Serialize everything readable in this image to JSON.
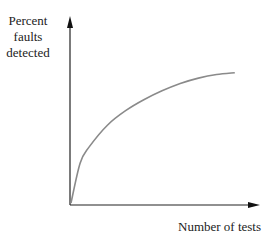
{
  "chart_data": {
    "type": "line",
    "title": "",
    "xlabel": "Number of tests",
    "ylabel_lines": [
      "Percent",
      "faults",
      "detected"
    ],
    "ylabel": "Percent faults detected",
    "grid": false,
    "legend": null,
    "ticks": false,
    "series": [
      {
        "name": "faults detected",
        "description": "Concave increasing curve rising steeply at first then leveling off (diminishing returns)",
        "x": [
          0,
          5,
          10,
          20,
          30,
          40,
          50,
          60,
          70,
          80,
          90
        ],
        "y": [
          0,
          22,
          31,
          43,
          51,
          57,
          62,
          66,
          69,
          71,
          72
        ]
      }
    ],
    "xlim": [
      0,
      100
    ],
    "ylim": [
      0,
      100
    ]
  },
  "colors": {
    "axis": "#222222",
    "curve": "#8a8a8a"
  }
}
